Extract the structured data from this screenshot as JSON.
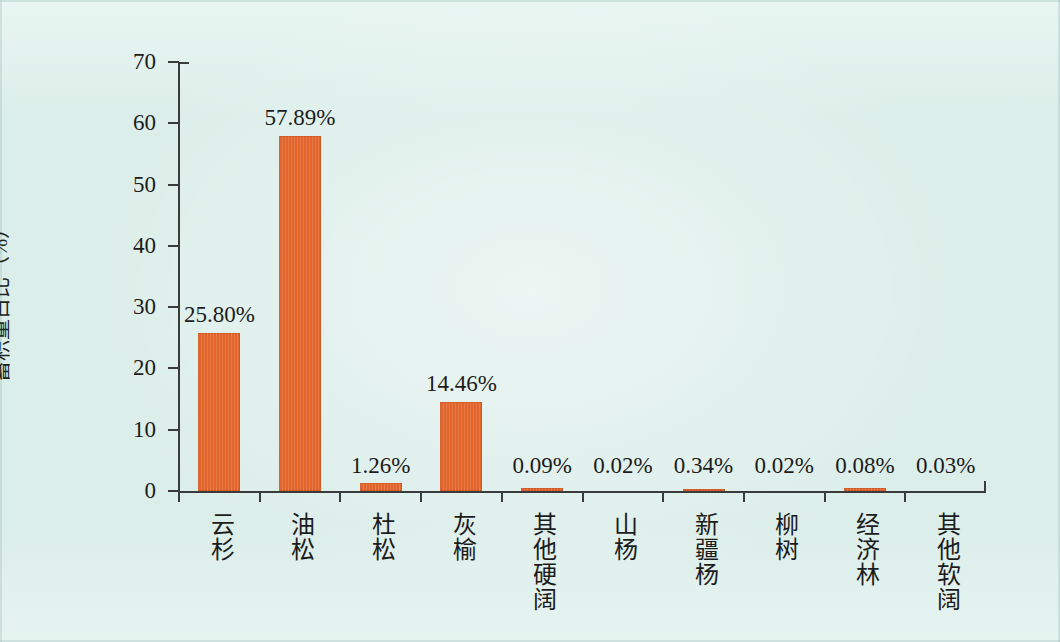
{
  "chart_data": {
    "type": "bar",
    "title": "",
    "xlabel": "",
    "ylabel": "蓄积量占比（%）",
    "ylim": [
      0,
      70
    ],
    "grid": false,
    "legend": null,
    "bar_color": "#e2652b",
    "background_color": "#dff0ec",
    "categories": [
      "云杉",
      "油松",
      "杜松",
      "灰榆",
      "其他硬阔",
      "山杨",
      "新疆杨",
      "柳树",
      "经济林",
      "其他软阔"
    ],
    "values": [
      25.8,
      57.89,
      1.26,
      14.46,
      0.09,
      0.02,
      0.34,
      0.02,
      0.08,
      0.03
    ],
    "data_labels": [
      "25.80%",
      "57.89%",
      "1.26%",
      "14.46%",
      "0.09%",
      "0.02%",
      "0.34%",
      "0.02%",
      "0.08%",
      "0.03%"
    ],
    "y_ticks": [
      0,
      10,
      20,
      30,
      40,
      50,
      60,
      70
    ],
    "y_tick_labels": [
      "0",
      "10",
      "20",
      "30",
      "40",
      "50",
      "60",
      "70"
    ]
  },
  "axes": {
    "y_title": "蓄积量占比（%）",
    "y_tick_labels": [
      "70",
      "60",
      "50",
      "40",
      "30",
      "20",
      "10",
      "0"
    ]
  },
  "bars": [
    {
      "category": "云杉",
      "value": 25.8,
      "label": "25.80%"
    },
    {
      "category": "油松",
      "value": 57.89,
      "label": "57.89%"
    },
    {
      "category": "杜松",
      "value": 1.26,
      "label": "1.26%"
    },
    {
      "category": "灰榆",
      "value": 14.46,
      "label": "14.46%"
    },
    {
      "category": "其他硬阔",
      "value": 0.09,
      "label": "0.09%"
    },
    {
      "category": "山杨",
      "value": 0.02,
      "label": "0.02%"
    },
    {
      "category": "新疆杨",
      "value": 0.34,
      "label": "0.34%"
    },
    {
      "category": "柳树",
      "value": 0.02,
      "label": "0.02%"
    },
    {
      "category": "经济林",
      "value": 0.08,
      "label": "0.08%"
    },
    {
      "category": "其他软阔",
      "value": 0.03,
      "label": "0.03%"
    }
  ]
}
